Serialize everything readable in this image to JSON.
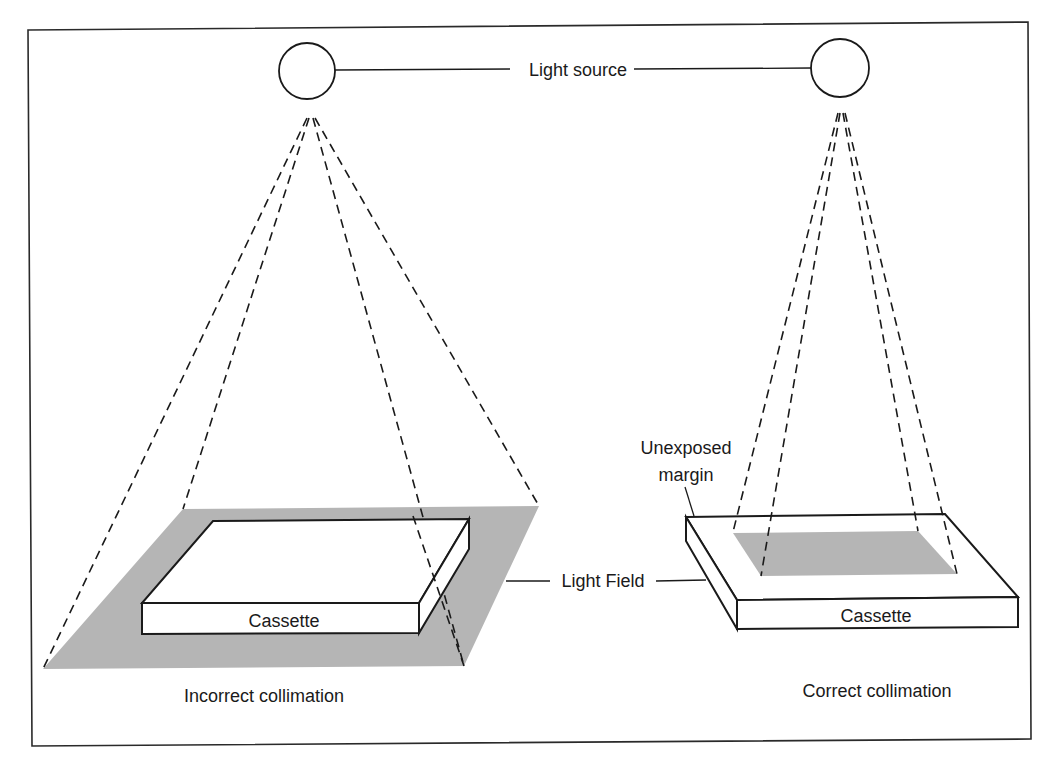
{
  "diagram": {
    "colors": {
      "line": "#1a1a1a",
      "light_field": "#b5b5b5",
      "background": "#ffffff"
    },
    "labels": {
      "light_source": "Light source",
      "light_field": "Light Field",
      "unexposed_margin_line1": "Unexposed",
      "unexposed_margin_line2": "margin",
      "cassette_left": "Cassette",
      "cassette_right": "Cassette",
      "incorrect_caption": "Incorrect collimation",
      "correct_caption": "Correct collimation"
    },
    "panels": [
      {
        "id": "left",
        "caption": "Incorrect collimation",
        "light_field_larger_than_cassette": true
      },
      {
        "id": "right",
        "caption": "Correct collimation",
        "light_field_larger_than_cassette": false
      }
    ]
  }
}
